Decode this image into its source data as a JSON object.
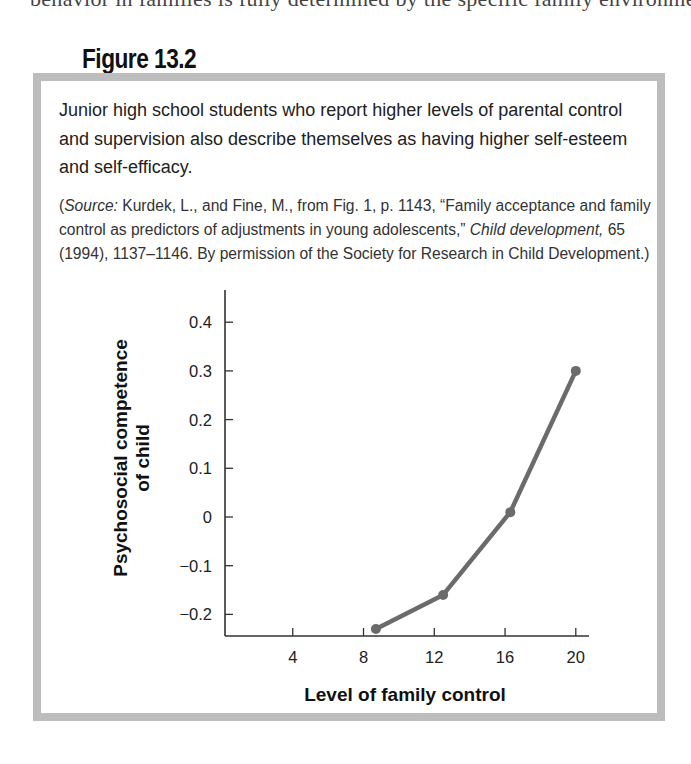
{
  "page": {
    "clipped_top_text": "behavior in families is fully determined by the specific family environment in which the child lives"
  },
  "figure": {
    "title": "Figure 13.2",
    "caption": "Junior high school students who report higher levels of parental control and supervision also describe themselves as having higher self-esteem and self-efficacy.",
    "source": {
      "open_paren": "(",
      "label": "Source:",
      "text_1": " Kurdek, L., and Fine, M., from Fig. 1, p. 1143, “Family acceptance and family control as predictors of adjustments in young adolescents,” ",
      "journal": "Child development,",
      "text_2": " 65 (1994), 1137–1146. By permission of the Society for Research in Child Development.)"
    },
    "frame_color": "#bdbdbd"
  },
  "chart_data": {
    "type": "line",
    "title": "",
    "xlabel": "Level of family control",
    "ylabel": "Psychosocial competence of child",
    "ylabel_lines": [
      "Psychosocial competence",
      "of child"
    ],
    "x": [
      8.7,
      12.5,
      16.3,
      20
    ],
    "values": [
      -0.23,
      -0.16,
      0.01,
      0.3
    ],
    "series": [
      {
        "name": "Psychosocial competence",
        "x": [
          8.7,
          12.5,
          16.3,
          20
        ],
        "values": [
          -0.23,
          -0.16,
          0.01,
          0.3
        ],
        "color": "#6b6b6b"
      }
    ],
    "xticks": [
      4,
      8,
      12,
      16,
      20
    ],
    "xtick_labels": [
      "4",
      "8",
      "12",
      "16",
      "20"
    ],
    "yticks": [
      0.4,
      0.3,
      0.2,
      0.1,
      0,
      -0.1,
      -0.2
    ],
    "ytick_labels": [
      "0.4",
      "0.3",
      "0.2",
      "0.1",
      "0",
      "−0.1",
      "−0.2"
    ],
    "xlim": [
      0,
      20.7
    ],
    "ylim": [
      -0.245,
      0.42
    ],
    "grid": false,
    "legend": null
  }
}
